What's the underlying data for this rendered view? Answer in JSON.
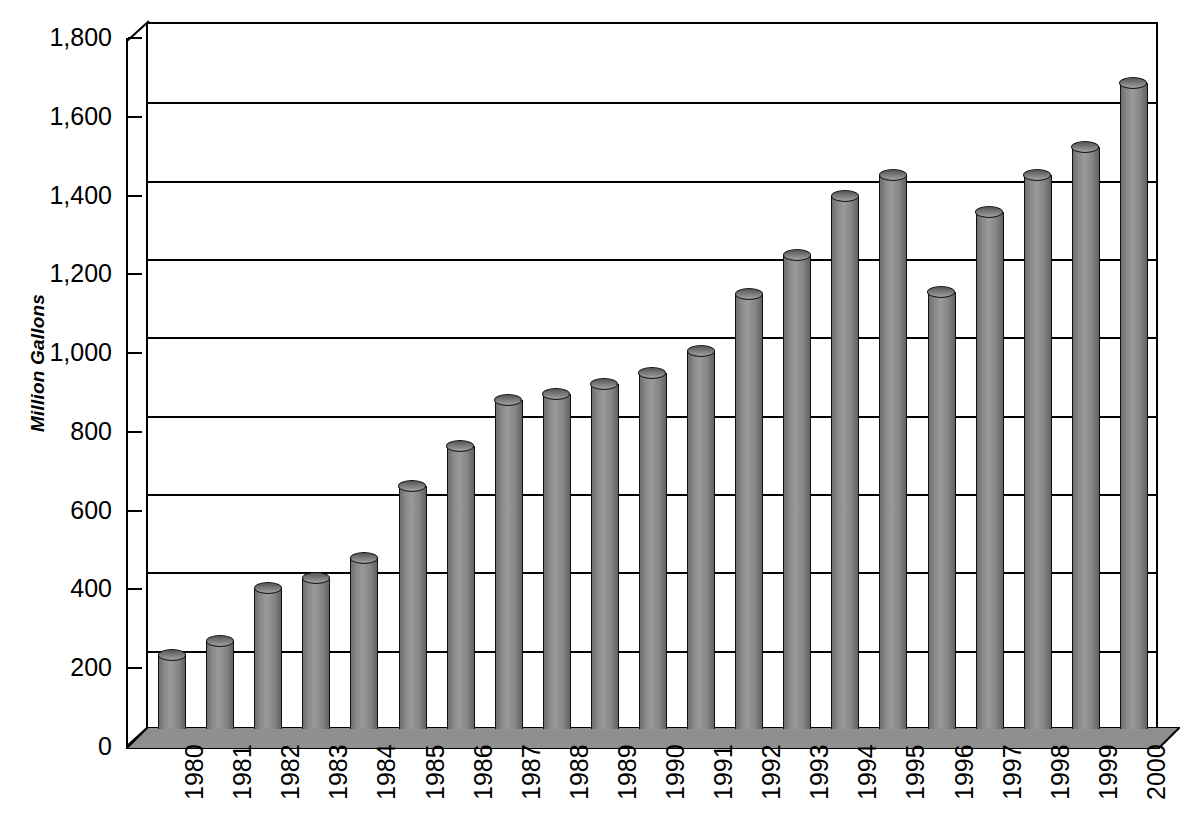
{
  "chart_data": {
    "type": "bar",
    "title": "",
    "xlabel": "",
    "ylabel": "Million Gallons",
    "ylim": [
      0,
      1800
    ],
    "ytick_step": 200,
    "ytick_labels": [
      "1,800",
      "1,600",
      "1,400",
      "1,200",
      "1,000",
      "800",
      "600",
      "400",
      "200",
      "0"
    ],
    "ytick_values": [
      1800,
      1600,
      1400,
      1200,
      1000,
      800,
      600,
      400,
      200,
      0
    ],
    "grid": true,
    "legend": "none",
    "style": "3d-cylinder-bars",
    "bar_color": "#8a8a8a",
    "categories": [
      "1980",
      "1981",
      "1982",
      "1983",
      "1984",
      "1985",
      "1986",
      "1987",
      "1988",
      "1989",
      "1990",
      "1991",
      "1992",
      "1993",
      "1994",
      "1995",
      "1996",
      "1997",
      "1998",
      "1999",
      "2000"
    ],
    "values": [
      190,
      225,
      360,
      385,
      437,
      620,
      722,
      840,
      855,
      880,
      910,
      965,
      1110,
      1210,
      1360,
      1415,
      1115,
      1320,
      1415,
      1485,
      1650
    ]
  }
}
